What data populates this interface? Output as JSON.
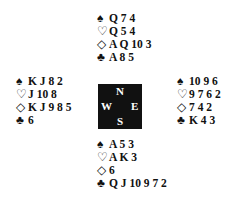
{
  "hands": {
    "north": {
      "spades": "Q 7 4",
      "hearts": "Q 5 4",
      "diamonds": "A Q 10 3",
      "clubs": "A 8 5"
    },
    "west": {
      "spades": "K J 8 2",
      "hearts": "J 10 8",
      "diamonds": "K J 9 8 5",
      "clubs": "6"
    },
    "east": {
      "spades": "10 9 6",
      "hearts": "9 7 6 2",
      "diamonds": "7 4 2",
      "clubs": "K 4 3"
    },
    "south": {
      "spades": "A 5 3",
      "hearts": "A K 3",
      "diamonds": "6",
      "clubs": "Q J 10 9 7 2"
    }
  },
  "suit_symbols": {
    "spades": "♠",
    "hearts": "♡",
    "diamonds": "◇",
    "clubs": "♣"
  },
  "compass": {
    "north": "N",
    "west": "W",
    "east": "E",
    "south": "S"
  }
}
